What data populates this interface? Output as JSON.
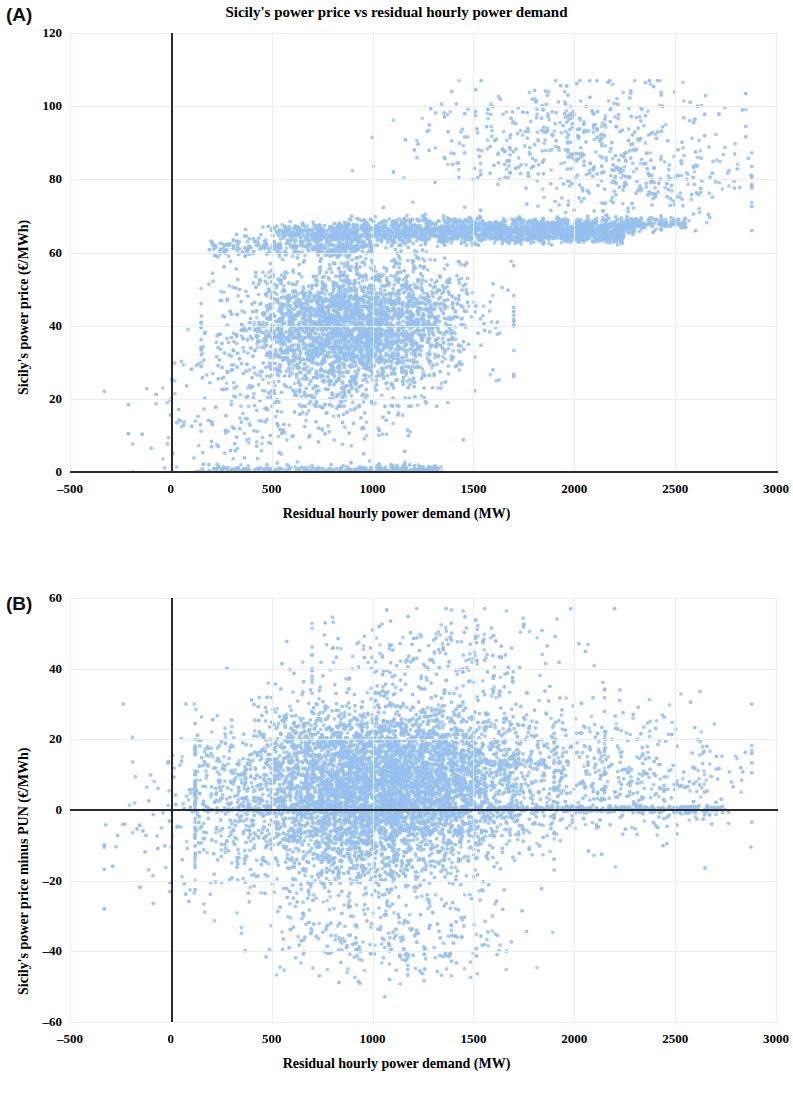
{
  "figure": {
    "background": "#ffffff",
    "point_color": "#96c0ef",
    "axis_color": "#2b2b2b",
    "grid_color": "#e9edf5"
  },
  "panels": [
    {
      "letter": "(A)",
      "title": "Sicily's power price vs residual hourly power demand"
    },
    {
      "letter": "(B)",
      "title": "Sicily's power price minus PUN vs Sicily's residual hourly power demand"
    }
  ],
  "chart_data": [
    {
      "type": "scatter",
      "panel": "(A)",
      "title": "Sicily's power price vs residual hourly power demand",
      "xlabel": "Residual hourly power demand  (MW)",
      "ylabel": "Sicily's power price (€/MWh)",
      "xlim": [
        -500,
        3000
      ],
      "ylim": [
        0,
        120
      ],
      "xticks": [
        -500,
        0,
        500,
        1000,
        1500,
        2000,
        2500,
        3000
      ],
      "xtick_labels": [
        "–500",
        "0",
        "500",
        "1000",
        "1500",
        "2000",
        "2500",
        "3000"
      ],
      "yticks": [
        0,
        20,
        40,
        60,
        80,
        100,
        120
      ],
      "ytick_labels": [
        "0",
        "20",
        "40",
        "60",
        "80",
        "100",
        "120"
      ],
      "grid": true,
      "legend": null,
      "marker_size": 2.6,
      "n_points": 8760,
      "series": [
        {
          "name": "hourly observations",
          "color": "#96c0ef",
          "clusters": [
            {
              "kind": "main_cloud",
              "n": 3050,
              "x_mean": 900,
              "x_sd": 290,
              "x_min": 150,
              "x_max": 1700,
              "y_mean": 40,
              "y_sd": 8.5,
              "y_min": 18,
              "y_max": 62,
              "slope": 0.0035
            },
            {
              "kind": "band",
              "n": 980,
              "x_min": 520,
              "x_max": 2250,
              "y_mean": 64.5,
              "y_sd": 0.9
            },
            {
              "kind": "band",
              "n": 760,
              "x_min": 430,
              "x_max": 2300,
              "y_mean": 66.4,
              "y_sd": 0.8
            },
            {
              "kind": "band",
              "n": 520,
              "x_min": 760,
              "x_max": 2560,
              "y_mean": 68.0,
              "y_sd": 0.9
            },
            {
              "kind": "band",
              "n": 300,
              "x_min": 180,
              "x_max": 1000,
              "y_mean": 61.5,
              "y_sd": 1.4
            },
            {
              "kind": "upper_cloud",
              "n": 430,
              "x_mean": 1950,
              "x_sd": 390,
              "x_min": 900,
              "x_max": 2850,
              "y_mean": 92,
              "y_sd": 7.5,
              "y_min": 70,
              "y_max": 107,
              "slope": 0.004
            },
            {
              "kind": "right_tail",
              "n": 240,
              "x_mean": 2350,
              "x_sd": 260,
              "x_min": 1850,
              "x_max": 2880,
              "y_mean": 79,
              "y_sd": 6.0,
              "y_min": 66,
              "y_max": 95,
              "slope": 0.0
            },
            {
              "kind": "zero_line",
              "n": 360,
              "x_min": 130,
              "x_max": 1350,
              "y_mean": 0.4,
              "y_sd": 0.6
            },
            {
              "kind": "low_left",
              "n": 150,
              "x_mean": 250,
              "x_sd": 230,
              "x_min": -330,
              "x_max": 720,
              "y_mean": 12,
              "y_sd": 9,
              "y_min": 0,
              "y_max": 40,
              "slope": 0.0
            },
            {
              "kind": "low_mid",
              "n": 180,
              "x_mean": 800,
              "x_sd": 250,
              "x_min": 300,
              "x_max": 1450,
              "y_mean": 17,
              "y_sd": 7,
              "y_min": 2,
              "y_max": 32,
              "slope": 0.0
            }
          ]
        }
      ]
    },
    {
      "type": "scatter",
      "panel": "(B)",
      "title": "Sicily's power price minus PUN vs Sicily's residual hourly power demand",
      "xlabel": "Residual hourly power demand  (MW)",
      "ylabel": "Sicily's power price minus PUN (€/MWh)",
      "xlim": [
        -500,
        3000
      ],
      "ylim": [
        -60,
        60
      ],
      "xticks": [
        -500,
        0,
        500,
        1000,
        1500,
        2000,
        2500,
        3000
      ],
      "xtick_labels": [
        "–500",
        "0",
        "500",
        "1000",
        "1500",
        "2000",
        "2500",
        "3000"
      ],
      "yticks": [
        -60,
        -40,
        -20,
        0,
        20,
        40,
        60
      ],
      "ytick_labels": [
        "–60",
        "–40",
        "–20",
        "0",
        "20",
        "40",
        "60"
      ],
      "grid": true,
      "legend": null,
      "marker_size": 2.6,
      "n_points": 8760,
      "series": [
        {
          "name": "hourly observations",
          "color": "#96c0ef",
          "clusters": [
            {
              "kind": "main_cloud",
              "n": 4600,
              "x_mean": 1080,
              "x_sd": 400,
              "x_min": 120,
              "x_max": 2150,
              "y_mean": 9.5,
              "y_sd": 10.5,
              "y_min": -38,
              "y_max": 52,
              "slope": 0.0015
            },
            {
              "kind": "main_cloud",
              "n": 1400,
              "x_mean": 950,
              "x_sd": 330,
              "x_min": 120,
              "x_max": 1900,
              "y_mean": -6.0,
              "y_sd": 11.0,
              "y_min": -48,
              "y_max": 18,
              "slope": 0.0
            },
            {
              "kind": "zero_line",
              "n": 520,
              "x_min": 150,
              "x_max": 2750,
              "y_mean": 0.2,
              "y_sd": 0.5
            },
            {
              "kind": "right_tail",
              "n": 380,
              "x_mean": 2300,
              "x_sd": 270,
              "x_min": 1900,
              "x_max": 2880,
              "y_mean": 10.0,
              "y_sd": 9.0,
              "y_min": -18,
              "y_max": 40,
              "slope": 0.0
            },
            {
              "kind": "low_left",
              "n": 170,
              "x_mean": 120,
              "x_sd": 210,
              "x_min": -330,
              "x_max": 600,
              "y_mean": -4.0,
              "y_sd": 13.0,
              "y_min": -42,
              "y_max": 30,
              "slope": 0.0
            },
            {
              "kind": "upper_cloud",
              "n": 230,
              "x_mean": 1320,
              "x_sd": 330,
              "x_min": 700,
              "x_max": 2200,
              "y_mean": 44,
              "y_sd": 6.0,
              "y_min": 33,
              "y_max": 57,
              "slope": 0.0
            },
            {
              "kind": "low_mid",
              "n": 260,
              "x_mean": 1050,
              "x_sd": 330,
              "x_min": 350,
              "x_max": 1900,
              "y_mean": -36,
              "y_sd": 6.5,
              "y_min": -56,
              "y_max": -24,
              "slope": 0.0
            }
          ]
        }
      ]
    }
  ]
}
